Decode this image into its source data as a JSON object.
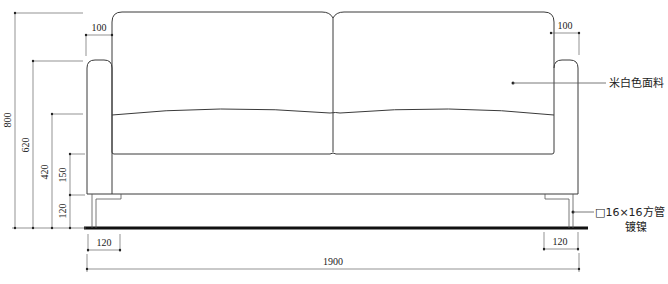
{
  "drawing": {
    "type": "sofa-front-elevation",
    "dimensions": {
      "overall_height": "800",
      "arm_height": "620",
      "seat_height": "420",
      "seat_cushion_to_base": "150",
      "leg_height": "120",
      "arm_width_left": "100",
      "arm_width_right": "100",
      "leg_offset_left": "120",
      "leg_offset_right": "120",
      "overall_width": "1900"
    },
    "annotations": {
      "fabric": "米白色面料",
      "leg_spec_line1": "□16×16方管",
      "leg_spec_line2": "镀镍"
    }
  }
}
